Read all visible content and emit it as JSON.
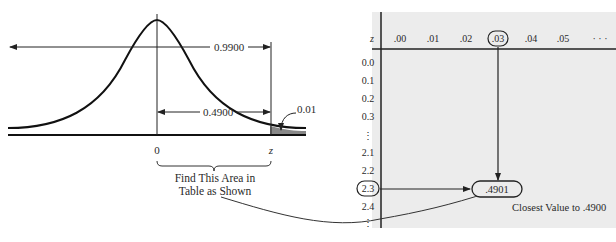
{
  "curve": {
    "area_total": "0.9900",
    "area_half": "0.4900",
    "tail_area": "0.01",
    "axis_zero": "0",
    "axis_z": "z",
    "find_label_line1": "Find This Area in",
    "find_label_line2": "Table as Shown"
  },
  "table": {
    "header_z": "z",
    "columns": [
      ".00",
      ".01",
      ".02",
      ".03",
      ".04",
      ".05",
      "· · ·"
    ],
    "rows": [
      "0.0",
      "0.1",
      "0.2",
      "0.3",
      "⋮",
      "2.1",
      "2.2",
      "2.3",
      "2.4",
      "⋮"
    ],
    "highlight_row": "2.3",
    "highlight_col": ".03",
    "found_value": ".4901",
    "closest_label": "Closest Value to .4900",
    "background": "#ececec"
  }
}
